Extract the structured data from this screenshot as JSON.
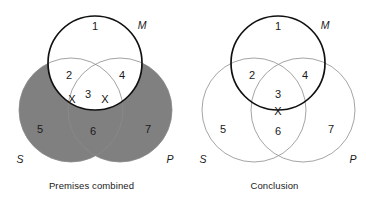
{
  "figure": {
    "type": "venn-diagram-pair",
    "background_color": "#ffffff"
  },
  "colors": {
    "shading_gray": "#808080",
    "minor_circle_stroke": "#999999",
    "major_circle_stroke": "#111111",
    "text": "#1a1a1a"
  },
  "panels": [
    {
      "id": "premises",
      "caption": "Premises combined",
      "set_labels": {
        "minor_left": "S",
        "minor_right": "P",
        "major": "M"
      },
      "region_numbers": [
        "1",
        "2",
        "3",
        "4",
        "5",
        "6",
        "7"
      ],
      "x_marks": [
        "X",
        "X"
      ],
      "shaded_regions": [
        "5",
        "6",
        "7"
      ],
      "unshaded_regions": [
        "1",
        "2",
        "3",
        "4"
      ],
      "emphasized_circle": "M"
    },
    {
      "id": "conclusion",
      "caption": "Conclusion",
      "set_labels": {
        "minor_left": "S",
        "minor_right": "P",
        "major": "M"
      },
      "region_numbers": [
        "1",
        "2",
        "3",
        "4",
        "5",
        "6",
        "7"
      ],
      "x_marks": [
        "X"
      ],
      "shaded_regions": [],
      "unshaded_regions": [
        "1",
        "2",
        "3",
        "4",
        "5",
        "6",
        "7"
      ],
      "emphasized_circle": "M"
    }
  ]
}
